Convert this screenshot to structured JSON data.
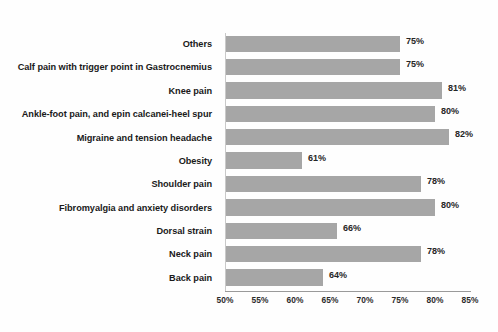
{
  "chart_data": {
    "type": "bar",
    "orientation": "horizontal",
    "title": "",
    "xlabel": "",
    "ylabel": "",
    "xlim": [
      50,
      85
    ],
    "xticks": [
      50,
      55,
      60,
      65,
      70,
      75,
      80,
      85
    ],
    "xtick_labels": [
      "50%",
      "55%",
      "60%",
      "65%",
      "70%",
      "75%",
      "80%",
      "85%"
    ],
    "grid": false,
    "legend": null,
    "bar_color": "#a6a6a6",
    "categories": [
      "Others",
      "Calf pain with trigger point in Gastrocnemius",
      "Knee pain",
      "Ankle-foot pain, and epin calcanei-heel spur",
      "Migraine and tension headache",
      "Obesity",
      "Shoulder pain",
      "Fibromyalgia and anxiety disorders",
      "Dorsal strain",
      "Neck pain",
      "Back pain"
    ],
    "values": [
      75,
      75,
      81,
      80,
      82,
      61,
      78,
      80,
      66,
      78,
      64
    ],
    "value_labels": [
      "75%",
      "75%",
      "81%",
      "80%",
      "82%",
      "61%",
      "78%",
      "80%",
      "66%",
      "78%",
      "64%"
    ]
  }
}
